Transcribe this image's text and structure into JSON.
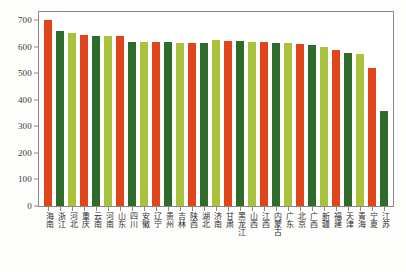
{
  "chart_data": {
    "type": "bar",
    "title": "",
    "subtitle": "",
    "xlabel": "",
    "ylabel": "",
    "ylim": [
      0,
      730
    ],
    "yticks": [
      0,
      100,
      200,
      300,
      400,
      500,
      600,
      700
    ],
    "ytick_labels": [
      "0",
      "100",
      "200",
      "300",
      "400",
      "500",
      "600",
      "700"
    ],
    "grid": false,
    "legend": null,
    "categories": [
      "海南",
      "浙江",
      "河北",
      "重庆",
      "云南",
      "河南",
      "山东",
      "四川",
      "安徽",
      "辽宁",
      "贵州",
      "吉林",
      "陕西",
      "湖北",
      "济南",
      "甘肃",
      "黑龙江",
      "山西",
      "江西",
      "内蒙古",
      "广东",
      "北京",
      "广西",
      "新疆",
      "福建",
      "天津",
      "青海",
      "宁夏",
      "江苏"
    ],
    "values": [
      700,
      660,
      650,
      643,
      640,
      638,
      638,
      618,
      618,
      618,
      616,
      614,
      612,
      612,
      624,
      622,
      620,
      618,
      617,
      615,
      612,
      610,
      606,
      600,
      588,
      575,
      572,
      520,
      358
    ],
    "bar_colors": [
      "#E0451C",
      "#2F6B2B",
      "#A9C23C"
    ],
    "color_cycle_note": "bars cycle orange-red, dark-green, yellow-green"
  },
  "caption": {
    "text": ""
  }
}
